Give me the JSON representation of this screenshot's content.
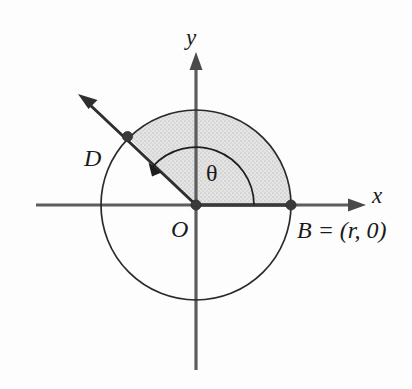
{
  "figure": {
    "background_color": "#fdfdfd",
    "axes": {
      "x_label": "x",
      "y_label": "y",
      "axis_color": "#5d5d5d"
    },
    "labels": {
      "origin": "O",
      "point_d": "D",
      "point_b": "B = (r, 0)",
      "angle": "θ"
    },
    "points": [
      {
        "name": "O",
        "label": "O",
        "x": 0,
        "y": 0,
        "role": "center"
      },
      {
        "name": "B",
        "label": "B = (r, 0)",
        "x": 1,
        "y": 0,
        "role": "terminal-on-x-axis"
      },
      {
        "name": "D",
        "label": "D",
        "x": -0.7071,
        "y": 0.7071,
        "role": "terminal-on-ray"
      }
    ],
    "circle": {
      "center_label": "O",
      "radius_symbol": "r",
      "outline_color": "#2a2a2a"
    },
    "sector": {
      "from_angle_deg": 0,
      "to_angle_deg": 135,
      "fill_color": "#d9d9d9",
      "description": "shaded sector OBD"
    },
    "angle": {
      "symbol": "θ",
      "measure_deg": 135,
      "direction": "counterclockwise",
      "from": "positive x-axis",
      "to": "ray OD"
    }
  }
}
